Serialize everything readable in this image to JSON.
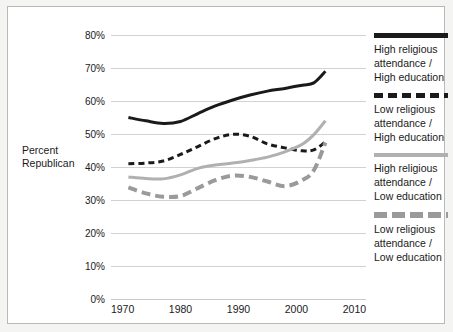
{
  "chart_data": {
    "type": "line",
    "title": "",
    "xlabel": "",
    "ylabel": "Percent Republican",
    "xlim": [
      1968,
      2012
    ],
    "ylim": [
      0,
      80
    ],
    "xticks": [
      "1970",
      "1980",
      "1990",
      "2000",
      "2010"
    ],
    "xtick_values": [
      1970,
      1980,
      1990,
      2000,
      2010
    ],
    "yticks": [
      "0%",
      "10%",
      "20%",
      "30%",
      "40%",
      "50%",
      "60%",
      "70%",
      "80%"
    ],
    "ytick_values": [
      0,
      10,
      20,
      30,
      40,
      50,
      60,
      70,
      80
    ],
    "grid": "horizontal",
    "legend_position": "right",
    "series": [
      {
        "name": "High religious attendance / High education",
        "style": "solid",
        "color": "#1a1a1a",
        "width": 3,
        "x": [
          1971,
          1974,
          1977,
          1980,
          1983,
          1986,
          1989,
          1992,
          1995,
          1998,
          2001,
          2003,
          2005
        ],
        "values": [
          55.0,
          54.0,
          53.2,
          53.8,
          56.2,
          58.5,
          60.3,
          61.8,
          63.0,
          63.8,
          64.8,
          65.5,
          69.0
        ]
      },
      {
        "name": "Low religious attendance / High education",
        "style": "dashed",
        "color": "#1a1a1a",
        "width": 3,
        "x": [
          1971,
          1974,
          1977,
          1980,
          1983,
          1986,
          1989,
          1992,
          1995,
          1998,
          2001,
          2003,
          2005
        ],
        "values": [
          41.0,
          41.2,
          41.8,
          43.8,
          46.2,
          48.6,
          49.9,
          49.3,
          47.0,
          45.8,
          44.9,
          45.2,
          47.6
        ]
      },
      {
        "name": "High religious attendance / Low education",
        "style": "solid",
        "color": "#b0b0b0",
        "width": 3,
        "x": [
          1971,
          1974,
          1977,
          1980,
          1983,
          1986,
          1989,
          1992,
          1995,
          1998,
          2001,
          2003,
          2005
        ],
        "values": [
          37.0,
          36.5,
          36.4,
          37.6,
          39.6,
          40.6,
          41.2,
          42.0,
          43.0,
          44.6,
          46.9,
          49.8,
          54.0
        ]
      },
      {
        "name": "Low religious attendance / Low education",
        "style": "dashed",
        "color": "#9a9a9a",
        "width": 4,
        "x": [
          1971,
          1974,
          1977,
          1980,
          1983,
          1986,
          1989,
          1992,
          1995,
          1998,
          2001,
          2003,
          2005
        ],
        "values": [
          33.8,
          32.0,
          31.0,
          31.2,
          33.6,
          36.0,
          37.4,
          37.0,
          35.6,
          34.2,
          36.0,
          39.0,
          47.4
        ]
      }
    ]
  },
  "axis": {
    "y_title": "Percent Republican"
  },
  "legend": {
    "entries": [
      {
        "swatch": "solid-black-line",
        "line1": "High religious",
        "line2": "attendance /",
        "line3": "High education"
      },
      {
        "swatch": "dashed-black-line",
        "line1": "Low religious",
        "line2": "attendance /",
        "line3": "High education"
      },
      {
        "swatch": "solid-gray-line",
        "line1": "High religious",
        "line2": "attendance /",
        "line3": "Low education"
      },
      {
        "swatch": "dashed-gray-line",
        "line1": "Low religious",
        "line2": "attendance /",
        "line3": "Low education"
      }
    ]
  }
}
